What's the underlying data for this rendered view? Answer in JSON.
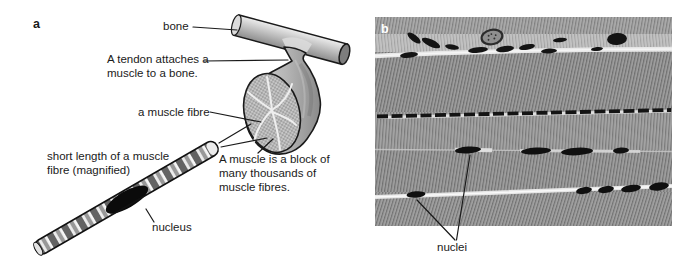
{
  "figure": {
    "panel_a": {
      "marker": "a",
      "labels": {
        "bone": "bone",
        "tendon_line1": "A tendon attaches a",
        "tendon_line2": "muscle to a bone.",
        "muscle_fibre": "a muscle fibre",
        "muscle_block_line1": "A muscle is a block of",
        "muscle_block_line2": "many thousands of",
        "muscle_block_line3": "muscle fibres.",
        "short_length_line1": "short length of a muscle",
        "short_length_line2": "fibre (magnified)",
        "nucleus": "nucleus"
      }
    },
    "panel_b": {
      "marker": "b",
      "labels": {
        "nuclei": "nuclei"
      }
    },
    "palette": {
      "background": "#ffffff",
      "line_color": "#1a1a1a",
      "bone_fill_light": "#e8e8e8",
      "bone_fill_dark": "#8d8d8d",
      "muscle_fill_light": "#d8d8d8",
      "muscle_fill_dark": "#919191",
      "micrograph_base_gray": "#9c9c9c",
      "micrograph_bright_line": "#e6e6e6",
      "nuclei_color": "#111111"
    }
  }
}
